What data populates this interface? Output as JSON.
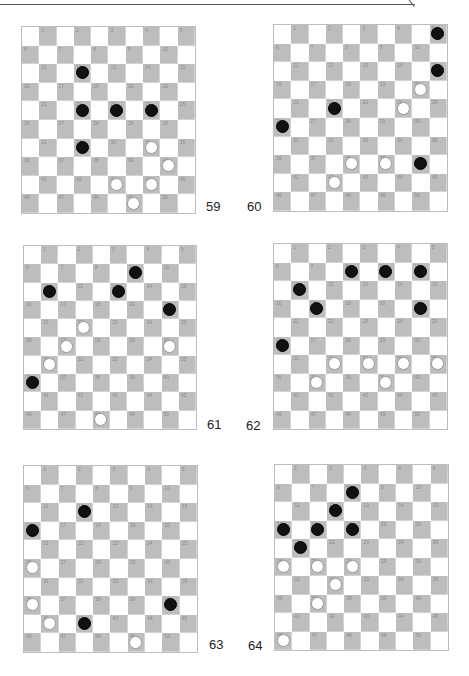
{
  "colors": {
    "dark_square": "#bdbdbd",
    "light_square": "#ffffff",
    "black_piece": "#111111",
    "white_piece": "#ffffff"
  },
  "boards": [
    {
      "number": "59",
      "box": {
        "left": 21,
        "top": 26,
        "width": 175,
        "height": 188
      },
      "label_pos": {
        "left": 206,
        "top": 199
      },
      "black": [
        12,
        22,
        23,
        24,
        32
      ],
      "white": [
        34,
        40,
        43,
        44,
        49
      ]
    },
    {
      "number": "60",
      "box": {
        "left": 273,
        "top": 24,
        "width": 175,
        "height": 188
      },
      "label_pos": {
        "left": 247,
        "top": 199
      },
      "black": [
        5,
        15,
        22,
        26,
        40
      ],
      "white": [
        20,
        24,
        38,
        39,
        42
      ]
    },
    {
      "number": "61",
      "box": {
        "left": 23,
        "top": 245,
        "width": 174,
        "height": 185
      },
      "label_pos": {
        "left": 207,
        "top": 417
      },
      "black": [
        9,
        11,
        13,
        20,
        36
      ],
      "white": [
        22,
        27,
        30,
        31,
        48
      ]
    },
    {
      "number": "62",
      "box": {
        "left": 273,
        "top": 243,
        "width": 175,
        "height": 187
      },
      "label_pos": {
        "left": 246,
        "top": 418
      },
      "black": [
        8,
        9,
        10,
        11,
        17,
        20,
        26
      ],
      "white": [
        32,
        33,
        34,
        35,
        37,
        39
      ]
    },
    {
      "number": "63",
      "box": {
        "left": 23,
        "top": 465,
        "width": 175,
        "height": 188
      },
      "label_pos": {
        "left": 209,
        "top": 637
      },
      "black": [
        12,
        16,
        40,
        42
      ],
      "white": [
        26,
        36,
        41,
        49
      ]
    },
    {
      "number": "64",
      "box": {
        "left": 274,
        "top": 464,
        "width": 175,
        "height": 187
      },
      "label_pos": {
        "left": 248,
        "top": 638
      },
      "black": [
        8,
        12,
        16,
        17,
        18,
        21
      ],
      "white": [
        26,
        27,
        28,
        32,
        37,
        46
      ]
    }
  ]
}
